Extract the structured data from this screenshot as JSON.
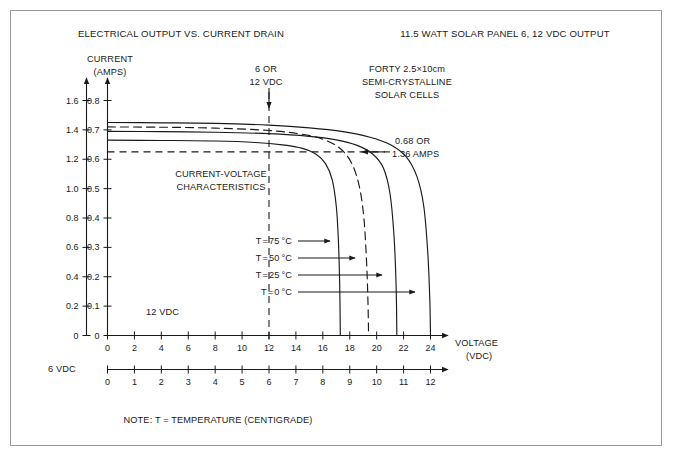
{
  "figure": {
    "title_left": "ELECTRICAL OUTPUT VS. CURRENT DRAIN",
    "title_right": "11.5 WATT SOLAR PANEL 6, 12 VDC OUTPUT",
    "footer_note": "NOTE: T = TEMPERATURE (CENTIGRADE)",
    "border_color": "#9a9a9a",
    "ink_color": "#1a1a1a",
    "background": "#ffffff"
  },
  "annotations": {
    "y_axis_title_line1": "CURRENT",
    "y_axis_title_line2": "(AMPS)",
    "x_axis_title_line1": "VOLTAGE",
    "x_axis_title_line2": "(VDC)",
    "panel_spec_line1": "FORTY 2.5×10cm",
    "panel_spec_line2": "SEMI-CRYSTALLINE",
    "panel_spec_line3": "SOLAR CELLS",
    "marker_line1": "6 OR",
    "marker_line2": "12 VDC",
    "plot_label_line1": "CURRENT-VOLTAGE",
    "plot_label_line2": "CHARACTERISTICS",
    "operating_point_line1": "0.68 OR",
    "operating_point_line2": "1.36 AMPS",
    "axis_label_upper": "12 VDC",
    "axis_label_lower": "6 VDC"
  },
  "chart_data": {
    "type": "line",
    "title": "ELECTRICAL OUTPUT VS. CURRENT DRAIN",
    "subtitle": "11.5 WATT SOLAR PANEL 6, 12 VDC OUTPUT",
    "xlabel": "VOLTAGE (VDC)",
    "ylabel": "CURRENT (AMPS)",
    "grid": false,
    "legend_position": "inline-arrow-callouts",
    "axes": {
      "x_primary": {
        "label": "12 VDC",
        "range": [
          0,
          24
        ],
        "ticks": [
          0,
          2,
          4,
          6,
          8,
          10,
          12,
          14,
          16,
          18,
          20,
          22,
          24
        ],
        "tick_labels": [
          "0",
          "2",
          "4",
          "6",
          "8",
          "10",
          "12",
          "14",
          "16",
          "18",
          "20",
          "22",
          "24"
        ]
      },
      "x_secondary": {
        "label": "6 VDC",
        "range": [
          0,
          12
        ],
        "ticks": [
          0,
          1,
          2,
          3,
          4,
          5,
          6,
          7,
          8,
          9,
          10,
          11,
          12
        ],
        "tick_labels": [
          "0",
          "1",
          "2",
          "3",
          "4",
          "5",
          "6",
          "7",
          "8",
          "9",
          "10",
          "11",
          "12"
        ]
      },
      "y_primary": {
        "label": "AMPS (inner scale)",
        "range": [
          0,
          0.8
        ],
        "ticks": [
          0,
          0.1,
          0.2,
          0.3,
          0.4,
          0.5,
          0.6,
          0.7,
          0.8
        ],
        "tick_labels": [
          "0",
          "0.1",
          "0.2",
          "0.3",
          "0.4",
          "0.5",
          "0.6",
          "0.7",
          "0.8"
        ]
      },
      "y_secondary": {
        "label": "AMPS (outer scale)",
        "range": [
          0,
          1.6
        ],
        "ticks": [
          0,
          0.2,
          0.4,
          0.6,
          0.8,
          1.0,
          1.2,
          1.4,
          1.6
        ],
        "tick_labels": [
          "0",
          "0.2",
          "0.4",
          "0.6",
          "0.8",
          "1.0",
          "1.2",
          "1.4",
          "1.6"
        ]
      }
    },
    "series": [
      {
        "name": "T = 75 °C",
        "label": "T = 75 °C",
        "style": "solid",
        "plateau_current": 0.665,
        "open_circuit_voltage": 17.3,
        "points": [
          [
            0,
            0.665
          ],
          [
            4,
            0.664
          ],
          [
            8,
            0.662
          ],
          [
            11,
            0.657
          ],
          [
            13,
            0.649
          ],
          [
            14.5,
            0.637
          ],
          [
            15.5,
            0.617
          ],
          [
            16.2,
            0.585
          ],
          [
            16.7,
            0.53
          ],
          [
            17.0,
            0.44
          ],
          [
            17.15,
            0.33
          ],
          [
            17.25,
            0.18
          ],
          [
            17.3,
            0.0
          ]
        ]
      },
      {
        "name": "T = 50 °C",
        "label": "T = 50 °C",
        "style": "dashed",
        "plateau_current": 0.71,
        "open_circuit_voltage": 19.4,
        "points": [
          [
            0,
            0.71
          ],
          [
            4,
            0.709
          ],
          [
            8,
            0.706
          ],
          [
            12,
            0.698
          ],
          [
            14.5,
            0.685
          ],
          [
            16,
            0.668
          ],
          [
            17.2,
            0.64
          ],
          [
            18.1,
            0.59
          ],
          [
            18.7,
            0.51
          ],
          [
            19.05,
            0.4
          ],
          [
            19.25,
            0.25
          ],
          [
            19.35,
            0.12
          ],
          [
            19.4,
            0.0
          ]
        ]
      },
      {
        "name": "T = 25 °C",
        "label": "T = 25 °C",
        "style": "solid",
        "plateau_current": 0.695,
        "open_circuit_voltage": 21.5,
        "points": [
          [
            0,
            0.695
          ],
          [
            4,
            0.694
          ],
          [
            8,
            0.692
          ],
          [
            12,
            0.687
          ],
          [
            15,
            0.678
          ],
          [
            17,
            0.666
          ],
          [
            18.5,
            0.648
          ],
          [
            19.7,
            0.618
          ],
          [
            20.5,
            0.57
          ],
          [
            21.0,
            0.48
          ],
          [
            21.3,
            0.33
          ],
          [
            21.45,
            0.16
          ],
          [
            21.5,
            0.0
          ]
        ]
      },
      {
        "name": "T = 0 °C",
        "label": "T = 0 °C",
        "style": "solid",
        "plateau_current": 0.725,
        "open_circuit_voltage": 24.0,
        "points": [
          [
            0,
            0.725
          ],
          [
            4,
            0.724
          ],
          [
            8,
            0.722
          ],
          [
            12,
            0.716
          ],
          [
            15,
            0.707
          ],
          [
            17.5,
            0.694
          ],
          [
            19.5,
            0.675
          ],
          [
            21,
            0.65
          ],
          [
            22.2,
            0.608
          ],
          [
            23.0,
            0.54
          ],
          [
            23.5,
            0.44
          ],
          [
            23.8,
            0.28
          ],
          [
            23.95,
            0.12
          ],
          [
            24.0,
            0.0
          ]
        ]
      }
    ],
    "reference_lines": [
      {
        "name": "operating-current",
        "orientation": "horizontal",
        "value": 0.625,
        "style": "dashed",
        "label": "0.68 OR 1.36 AMPS"
      },
      {
        "name": "operating-voltage",
        "orientation": "vertical",
        "value": 12,
        "style": "dashed",
        "label": "6 OR 12 VDC"
      }
    ]
  }
}
